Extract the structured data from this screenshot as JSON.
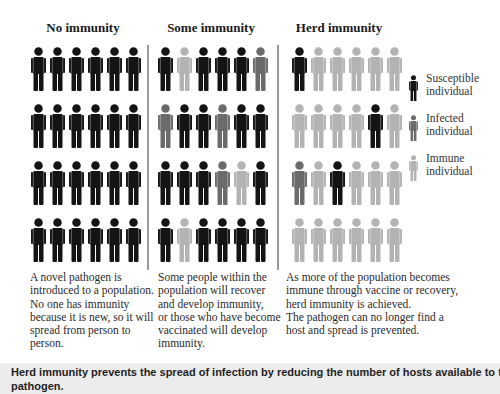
{
  "colors": {
    "susceptible": "#141414",
    "infected": "#6b6b6b",
    "immune": "#b3b3b3",
    "divider": "#9a9a9a",
    "caption_bg": "#ececec"
  },
  "panels": [
    {
      "title": "No immunity",
      "grid": [
        [
          "S",
          "S",
          "S",
          "S",
          "S",
          "S"
        ],
        [
          "S",
          "S",
          "S",
          "S",
          "S",
          "S"
        ],
        [
          "S",
          "S",
          "S",
          "S",
          "S",
          "S"
        ],
        [
          "S",
          "S",
          "S",
          "S",
          "S",
          "S"
        ]
      ],
      "description_lines": [
        "A novel pathogen is",
        "introduced to a population.",
        "No one has immunity",
        "because it is new, so it will",
        "spread from person to",
        "person."
      ]
    },
    {
      "title": "Some immunity",
      "grid": [
        [
          "S",
          "M",
          "S",
          "S",
          "S",
          "I"
        ],
        [
          "I",
          "S",
          "S",
          "I",
          "S",
          "S"
        ],
        [
          "S",
          "S",
          "S",
          "I",
          "M",
          "S"
        ],
        [
          "S",
          "M",
          "S",
          "S",
          "S",
          "S"
        ]
      ],
      "description_lines": [
        "Some people within the",
        "population will recover",
        "and develop immunity,",
        "or those who have become",
        "vaccinated will develop",
        "immunity."
      ]
    },
    {
      "title": "Herd immunity",
      "grid": [
        [
          "S",
          "M",
          "M",
          "M",
          "M",
          "M"
        ],
        [
          "M",
          "M",
          "M",
          "M",
          "S",
          "M"
        ],
        [
          "I",
          "M",
          "S",
          "M",
          "M",
          "M"
        ],
        [
          "M",
          "M",
          "M",
          "M",
          "M",
          "M"
        ]
      ],
      "description_lines": [
        "As more of the population becomes",
        "immune through vaccine or recovery,",
        "herd immunity is achieved.",
        "The pathogen can no longer find a",
        "host and spread is prevented."
      ]
    }
  ],
  "legend": [
    {
      "key": "S",
      "icon": "person-icon",
      "line1": "Susceptible",
      "line2": "individual"
    },
    {
      "key": "I",
      "icon": "person-icon",
      "line1": "Infected",
      "line2": "individual"
    },
    {
      "key": "M",
      "icon": "person-icon",
      "line1": "Immune",
      "line2": "individual"
    }
  ],
  "caption": {
    "line1": "Herd immunity prevents the spread of infection by reducing the number of hosts available to the",
    "line2": "pathogen."
  }
}
